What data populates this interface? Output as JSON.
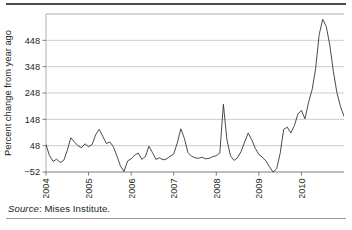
{
  "figure": {
    "source_label": "Source",
    "source_separator": ": ",
    "source_text": "Mises Institute."
  },
  "chart_data": {
    "type": "line",
    "title": "",
    "subtitle": "",
    "xlabel": "",
    "ylabel": "Percent change from year ago",
    "ylim": [
      -52,
      548
    ],
    "xlim": [
      2004.0,
      2011.0
    ],
    "yticks": [
      -52,
      48,
      148,
      248,
      348,
      448
    ],
    "ytick_labels": [
      "−52",
      "48",
      "148",
      "248",
      "348",
      "448"
    ],
    "xticks": [
      2004,
      2005,
      2006,
      2007,
      2008,
      2009,
      2010
    ],
    "xtick_labels": [
      "2004",
      "2005",
      "2006",
      "2007",
      "2008",
      "2009",
      "2010"
    ],
    "xtick_rotation": 90,
    "grid": true,
    "grid_axis": "y",
    "legend": false,
    "legend_position": "none",
    "line_color": "#2b2b2b",
    "grid_color": "#b8b8b8",
    "axis_color": "#6d6d6d",
    "series": [
      {
        "name": "Percent change from year ago",
        "x": [
          2004.0,
          2004.083,
          2004.167,
          2004.25,
          2004.333,
          2004.417,
          2004.5,
          2004.583,
          2004.667,
          2004.75,
          2004.833,
          2004.917,
          2005.0,
          2005.083,
          2005.167,
          2005.25,
          2005.333,
          2005.417,
          2005.5,
          2005.583,
          2005.667,
          2005.75,
          2005.833,
          2005.917,
          2006.0,
          2006.083,
          2006.167,
          2006.25,
          2006.333,
          2006.417,
          2006.5,
          2006.583,
          2006.667,
          2006.75,
          2006.833,
          2006.917,
          2007.0,
          2007.083,
          2007.167,
          2007.25,
          2007.333,
          2007.417,
          2007.5,
          2007.583,
          2007.667,
          2007.75,
          2007.833,
          2007.917,
          2008.0,
          2008.083,
          2008.167,
          2008.25,
          2008.333,
          2008.417,
          2008.5,
          2008.583,
          2008.667,
          2008.75,
          2008.833,
          2008.917,
          2009.0,
          2009.083,
          2009.167,
          2009.25,
          2009.333,
          2009.417,
          2009.5,
          2009.583,
          2009.667,
          2009.75,
          2009.833,
          2009.917,
          2010.0,
          2010.083,
          2010.167,
          2010.25,
          2010.333,
          2010.417,
          2010.5,
          2010.583,
          2010.667,
          2010.75,
          2010.833,
          2010.917,
          2011.0
        ],
        "values": [
          52,
          10,
          -12,
          -3,
          -16,
          -8,
          30,
          78,
          62,
          48,
          40,
          55,
          44,
          52,
          90,
          110,
          84,
          56,
          62,
          44,
          8,
          -30,
          -50,
          -10,
          -2,
          12,
          20,
          -4,
          6,
          46,
          22,
          -4,
          2,
          -6,
          -2,
          8,
          16,
          58,
          112,
          76,
          22,
          8,
          2,
          0,
          4,
          -2,
          0,
          6,
          10,
          20,
          205,
          70,
          10,
          -8,
          2,
          26,
          62,
          96,
          70,
          38,
          14,
          4,
          -10,
          -32,
          -52,
          -40,
          18,
          110,
          118,
          96,
          124,
          168,
          182,
          150,
          212,
          260,
          340,
          470,
          528,
          500,
          430,
          330,
          250,
          196,
          160
        ]
      }
    ],
    "annotations": []
  }
}
